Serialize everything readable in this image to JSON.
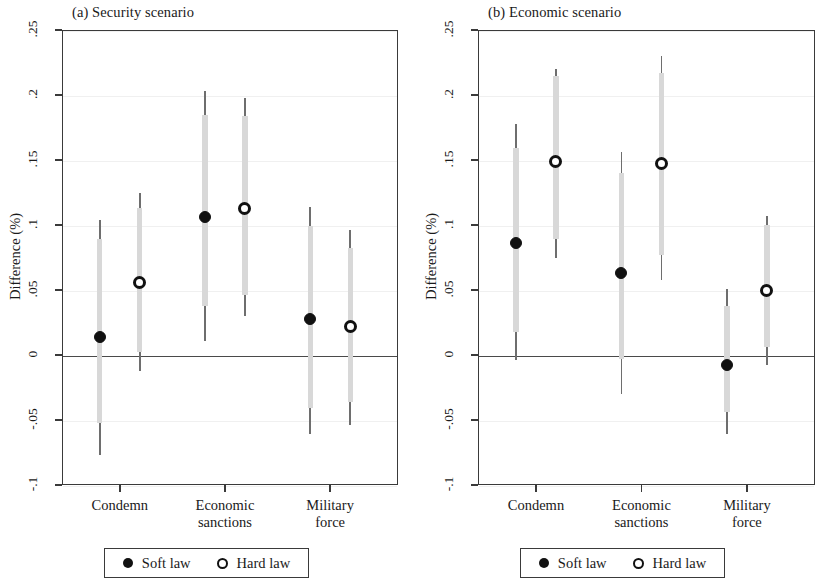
{
  "figure": {
    "y_axis_title": "Difference (%)",
    "legend": {
      "soft_label": "Soft law",
      "hard_label": "Hard law",
      "soft_marker": "filled-circle",
      "hard_marker": "open-circle"
    },
    "colors": {
      "marker": "#111111",
      "ci_outer": "#6e6e6e",
      "ci_inner": "#d8d8d8",
      "frame": "#3a3a3a",
      "grid": "#f0f0f0",
      "zero_line": "#4a4a4a",
      "background": "#ffffff"
    }
  },
  "chart_data": [
    {
      "type": "scatter",
      "title": "(a) Security scenario",
      "xlabel": "",
      "ylabel": "Difference (%)",
      "ylim": [
        -0.1,
        0.25
      ],
      "yticks": [
        0.25,
        0.2,
        0.15,
        0.1,
        0.05,
        0,
        -0.05,
        -0.1
      ],
      "ytick_labels": [
        ".25",
        ".2",
        ".15",
        ".1",
        ".05",
        "0",
        "-.05",
        "-.1"
      ],
      "grid": true,
      "zero_line": 0,
      "categories": [
        "Condemn",
        "Economic\nsanctions",
        "Military\nforce"
      ],
      "legend_position": "below",
      "series": [
        {
          "name": "Soft law",
          "marker": "filled-circle",
          "values": [
            0.014,
            0.106,
            0.028
          ],
          "ci_low": [
            -0.077,
            0.011,
            -0.061
          ],
          "ci_high": [
            0.104,
            0.203,
            0.114
          ],
          "ci_inner_low": [
            -0.052,
            0.038,
            -0.041
          ],
          "ci_inner_high": [
            0.089,
            0.185,
            0.099
          ]
        },
        {
          "name": "Hard law",
          "marker": "open-circle",
          "values": [
            0.056,
            0.113,
            0.022
          ],
          "ci_low": [
            -0.012,
            0.03,
            -0.054
          ],
          "ci_high": [
            0.125,
            0.198,
            0.096
          ],
          "ci_inner_low": [
            0.002,
            0.046,
            -0.036
          ],
          "ci_inner_high": [
            0.113,
            0.184,
            0.082
          ]
        }
      ]
    },
    {
      "type": "scatter",
      "title": "(b) Economic scenario",
      "xlabel": "",
      "ylabel": "Difference (%)",
      "ylim": [
        -0.1,
        0.25
      ],
      "yticks": [
        0.25,
        0.2,
        0.15,
        0.1,
        0.05,
        0,
        -0.05,
        -0.1
      ],
      "ytick_labels": [
        ".25",
        ".2",
        ".15",
        ".1",
        ".05",
        "0",
        "-.05",
        "-.1"
      ],
      "grid": true,
      "zero_line": 0,
      "categories": [
        "Condemn",
        "Economic\nsanctions",
        "Military\nforce"
      ],
      "legend_position": "below",
      "series": [
        {
          "name": "Soft law",
          "marker": "filled-circle",
          "values": [
            0.086,
            0.063,
            -0.008
          ],
          "ci_low": [
            -0.004,
            -0.03,
            -0.061
          ],
          "ci_high": [
            0.178,
            0.156,
            0.051
          ],
          "ci_inner_low": [
            0.018,
            -0.003,
            -0.044
          ],
          "ci_inner_high": [
            0.159,
            0.14,
            0.038
          ]
        },
        {
          "name": "Hard law",
          "marker": "open-circle",
          "values": [
            0.149,
            0.147,
            0.05
          ],
          "ci_low": [
            0.075,
            0.058,
            -0.008
          ],
          "ci_high": [
            0.22,
            0.23,
            0.107
          ],
          "ci_inner_low": [
            0.089,
            0.077,
            0.006
          ],
          "ci_inner_high": [
            0.215,
            0.217,
            0.1
          ]
        }
      ]
    }
  ]
}
